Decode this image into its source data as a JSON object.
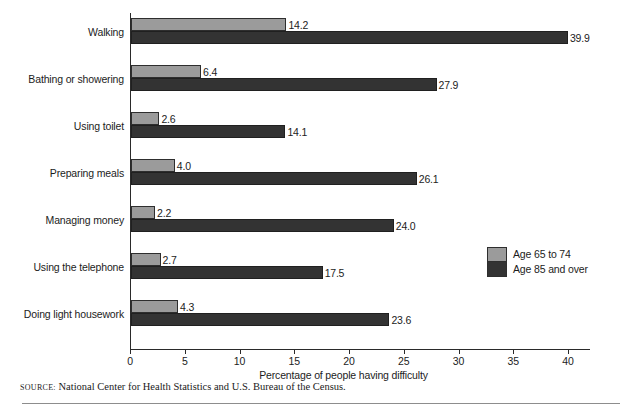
{
  "chart_data": {
    "type": "bar",
    "orientation": "horizontal",
    "title": "",
    "xlabel": "Percentage of people having difficulty",
    "ylabel": "",
    "xlim": [
      0,
      40
    ],
    "xticks": [
      0,
      5,
      10,
      15,
      20,
      25,
      30,
      35,
      40
    ],
    "grid": false,
    "legend_position": "right",
    "categories": [
      "Walking",
      "Bathing or showering",
      "Using toilet",
      "Preparing meals",
      "Managing money",
      "Using the telephone",
      "Doing light housework"
    ],
    "series": [
      {
        "name": "Age 65 to 74",
        "color": "#9b9b9b",
        "values": [
          14.2,
          6.4,
          2.6,
          4.0,
          2.2,
          2.7,
          4.3
        ],
        "labels": [
          "14.2",
          "6.4",
          "2.6",
          "4.0",
          "2.2",
          "2.7",
          "4.3"
        ]
      },
      {
        "name": "Age 85 and over",
        "color": "#333333",
        "values": [
          39.9,
          27.9,
          14.1,
          26.1,
          24.0,
          17.5,
          23.6
        ],
        "labels": [
          "39.9",
          "27.9",
          "14.1",
          "26.1",
          "24.0",
          "17.5",
          "23.6"
        ]
      }
    ]
  },
  "legend": {
    "items": [
      {
        "label": "Age 65 to 74"
      },
      {
        "label": "Age 85 and over"
      }
    ]
  },
  "source": {
    "label": "Source:",
    "text": "National Center for Health Statistics and U.S. Bureau of the Census."
  }
}
